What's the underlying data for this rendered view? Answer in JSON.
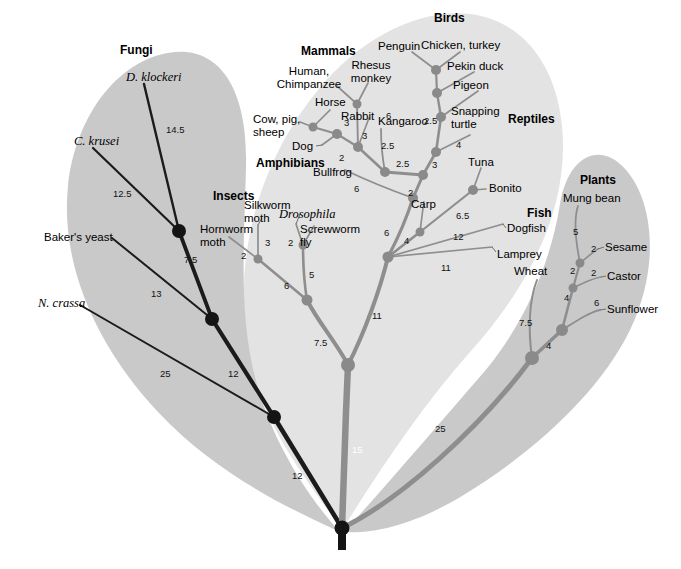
{
  "figure": {
    "kind": "phylogenetic-tree",
    "root_label": "",
    "background": "#ffffff"
  },
  "colors": {
    "lobe_outer": "#c9c9c9",
    "lobe_center": "#e3e3e3",
    "branch_dark": "#1b1b1b",
    "branch_mid": "#8e8e8e",
    "node_dark": "#141414",
    "node_mid": "#8a8a8a",
    "text": "#000000"
  },
  "groups": [
    {
      "id": "fungi",
      "label": "Fungi",
      "x": 120,
      "y": 44
    },
    {
      "id": "mammals",
      "label": "Mammals",
      "x": 301,
      "y": 45
    },
    {
      "id": "birds",
      "label": "Birds",
      "x": 434,
      "y": 12
    },
    {
      "id": "reptiles",
      "label": "Reptiles",
      "x": 508,
      "y": 113
    },
    {
      "id": "fish",
      "label": "Fish",
      "x": 527,
      "y": 207
    },
    {
      "id": "plants",
      "label": "Plants",
      "x": 580,
      "y": 174
    },
    {
      "id": "amphibians",
      "label": "Amphibians",
      "x": 256,
      "y": 157
    },
    {
      "id": "insects",
      "label": "Insects",
      "x": 213,
      "y": 190
    }
  ],
  "taxa": [
    {
      "id": "d-klockeri",
      "label": "D. klockeri",
      "style": "italic",
      "x": 126,
      "y": 71,
      "align": "left"
    },
    {
      "id": "c-krusei",
      "label": "C. krusei",
      "style": "italic",
      "x": 74,
      "y": 135,
      "align": "left"
    },
    {
      "id": "bakers-yeast",
      "label": "Baker's yeast",
      "style": "plain",
      "x": 44,
      "y": 231,
      "align": "left"
    },
    {
      "id": "n-crassa",
      "label": "N. crassa",
      "style": "italic",
      "x": 38,
      "y": 297,
      "align": "left"
    },
    {
      "id": "human-chimp",
      "label": "Human,\nChimpanzee",
      "style": "plain",
      "x": 303,
      "y": 71,
      "align": "center"
    },
    {
      "id": "rhesus-monkey",
      "label": "Rhesus\nmonkey",
      "style": "plain",
      "x": 368,
      "y": 65,
      "align": "center"
    },
    {
      "id": "horse",
      "label": "Horse",
      "style": "plain",
      "x": 315,
      "y": 102,
      "align": "left"
    },
    {
      "id": "cow-pig-sheep",
      "label": "Cow, pig,\nsheep",
      "style": "plain",
      "x": 276,
      "y": 117,
      "align": "left"
    },
    {
      "id": "rabbit",
      "label": "Rabbit",
      "style": "plain",
      "x": 341,
      "y": 112,
      "align": "left"
    },
    {
      "id": "kangaroo",
      "label": "Kangaroo",
      "style": "plain",
      "x": 380,
      "y": 118,
      "align": "left"
    },
    {
      "id": "dog",
      "label": "Dog",
      "style": "plain",
      "x": 299,
      "y": 142,
      "align": "left"
    },
    {
      "id": "bullfrog",
      "label": "Bullfrog",
      "style": "plain",
      "x": 315,
      "y": 167,
      "align": "left"
    },
    {
      "id": "penguin",
      "label": "Penguin",
      "style": "plain",
      "x": 382,
      "y": 42,
      "align": "left"
    },
    {
      "id": "chicken-turkey",
      "label": "Chicken, turkey",
      "style": "plain",
      "x": 424,
      "y": 41,
      "align": "left"
    },
    {
      "id": "pekin-duck",
      "label": "Pekin duck",
      "style": "plain",
      "x": 447,
      "y": 62,
      "align": "left"
    },
    {
      "id": "pigeon",
      "label": "Pigeon",
      "style": "plain",
      "x": 453,
      "y": 81,
      "align": "left"
    },
    {
      "id": "snapping-turtle",
      "label": "Snapping\nturtle",
      "style": "plain",
      "x": 453,
      "y": 111,
      "align": "left"
    },
    {
      "id": "tuna",
      "label": "Tuna",
      "style": "plain",
      "x": 470,
      "y": 160,
      "align": "left"
    },
    {
      "id": "bonito",
      "label": "Bonito",
      "style": "plain",
      "x": 489,
      "y": 184,
      "align": "left"
    },
    {
      "id": "carp",
      "label": "Carp",
      "style": "plain",
      "x": 411,
      "y": 202,
      "align": "left"
    },
    {
      "id": "dogfish",
      "label": "Dogfish",
      "style": "plain",
      "x": 506,
      "y": 228,
      "align": "left"
    },
    {
      "id": "lamprey",
      "label": "Lamprey",
      "style": "plain",
      "x": 495,
      "y": 254,
      "align": "left"
    },
    {
      "id": "silkworm-moth",
      "label": "Silkworm\nmoth",
      "style": "plain",
      "x": 245,
      "y": 205,
      "align": "left"
    },
    {
      "id": "hornworm-moth",
      "label": "Hornworm\nmoth",
      "style": "plain",
      "x": 203,
      "y": 228,
      "align": "left"
    },
    {
      "id": "drosophila",
      "label": "Drosophila",
      "style": "italic",
      "x": 283,
      "y": 215,
      "align": "left"
    },
    {
      "id": "screwworm-fly",
      "label": "Screwworm\nfly",
      "style": "plain",
      "x": 303,
      "y": 228,
      "align": "left"
    },
    {
      "id": "mung-bean",
      "label": "Mung bean",
      "style": "plain",
      "x": 565,
      "y": 196,
      "align": "left"
    },
    {
      "id": "sesame",
      "label": "Sesame",
      "style": "plain",
      "x": 601,
      "y": 244,
      "align": "left"
    },
    {
      "id": "castor",
      "label": "Castor",
      "style": "plain",
      "x": 604,
      "y": 273,
      "align": "left"
    },
    {
      "id": "sunflower",
      "label": "Sunflower",
      "style": "plain",
      "x": 603,
      "y": 306,
      "align": "left"
    },
    {
      "id": "wheat",
      "label": "Wheat",
      "style": "plain",
      "x": 514,
      "y": 268,
      "align": "left"
    }
  ],
  "branch_lengths": [
    {
      "id": "len-dklockeri",
      "value": "14.5",
      "x": 166,
      "y": 124,
      "white": false
    },
    {
      "id": "len-ckrusei",
      "value": "12.5",
      "x": 113,
      "y": 188,
      "white": false
    },
    {
      "id": "len-bakers",
      "value": "13",
      "x": 151,
      "y": 288,
      "white": false
    },
    {
      "id": "len-ncrassa",
      "value": "25",
      "x": 160,
      "y": 368,
      "white": false
    },
    {
      "id": "len-fungi-75",
      "value": "7.5",
      "x": 184,
      "y": 254,
      "white": false
    },
    {
      "id": "len-fungi-12a",
      "value": "12",
      "x": 228,
      "y": 368,
      "white": false
    },
    {
      "id": "len-fungi-12b",
      "value": "12",
      "x": 292,
      "y": 470,
      "white": false
    },
    {
      "id": "len-cowpig-3",
      "value": "3",
      "x": 344,
      "y": 120,
      "white": false
    },
    {
      "id": "len-rabbit-6",
      "value": "6",
      "x": 386,
      "y": 113,
      "white": false
    },
    {
      "id": "len-horse-3",
      "value": "3",
      "x": 362,
      "y": 133,
      "white": false
    },
    {
      "id": "len-dog-2",
      "value": "2",
      "x": 339,
      "y": 155,
      "white": false
    },
    {
      "id": "len-mam-25a",
      "value": "2.5",
      "x": 386,
      "y": 143,
      "white": false
    },
    {
      "id": "len-mam-25b",
      "value": "2.5",
      "x": 400,
      "y": 160,
      "white": false
    },
    {
      "id": "len-bullfrog-6",
      "value": "6",
      "x": 354,
      "y": 186,
      "white": false
    },
    {
      "id": "len-tetra-2",
      "value": "2",
      "x": 408,
      "y": 190,
      "white": false
    },
    {
      "id": "len-amniote-3",
      "value": "3",
      "x": 432,
      "y": 162,
      "white": false
    },
    {
      "id": "len-turtle-4",
      "value": "4",
      "x": 456,
      "y": 142,
      "white": false
    },
    {
      "id": "len-bird-25",
      "value": "2.5",
      "x": 428,
      "y": 118,
      "white": false
    },
    {
      "id": "len-tuna-65",
      "value": "6.5",
      "x": 458,
      "y": 213,
      "white": false
    },
    {
      "id": "len-carp-4",
      "value": "4",
      "x": 404,
      "y": 238,
      "white": false
    },
    {
      "id": "len-vert-6",
      "value": "6",
      "x": 386,
      "y": 230,
      "white": false
    },
    {
      "id": "len-dogfish-12",
      "value": "12",
      "x": 455,
      "y": 234,
      "white": false
    },
    {
      "id": "len-lamprey-11",
      "value": "11",
      "x": 443,
      "y": 265,
      "white": false
    },
    {
      "id": "len-horn-2",
      "value": "2",
      "x": 243,
      "y": 253,
      "white": false
    },
    {
      "id": "len-silk-3",
      "value": "3",
      "x": 265,
      "y": 240,
      "white": false
    },
    {
      "id": "len-dros-2",
      "value": "2",
      "x": 288,
      "y": 240,
      "white": false
    },
    {
      "id": "len-moth-6",
      "value": "6",
      "x": 286,
      "y": 283,
      "white": false
    },
    {
      "id": "len-fly-5",
      "value": "5",
      "x": 309,
      "y": 272,
      "white": false
    },
    {
      "id": "len-insect-75",
      "value": "7.5",
      "x": 316,
      "y": 340,
      "white": false
    },
    {
      "id": "len-vert-11",
      "value": "11",
      "x": 374,
      "y": 313,
      "white": false
    },
    {
      "id": "len-trunk-15",
      "value": "15",
      "x": 352,
      "y": 447,
      "white": true
    },
    {
      "id": "len-mung-5",
      "value": "5",
      "x": 575,
      "y": 229,
      "white": false
    },
    {
      "id": "len-sesame-2",
      "value": "2",
      "x": 592,
      "y": 246,
      "white": false
    },
    {
      "id": "len-plant-2a",
      "value": "2",
      "x": 572,
      "y": 268,
      "white": false
    },
    {
      "id": "len-castor-2",
      "value": "2",
      "x": 592,
      "y": 270,
      "white": false
    },
    {
      "id": "len-plant-4a",
      "value": "4",
      "x": 566,
      "y": 295,
      "white": false
    },
    {
      "id": "len-sunflower-6",
      "value": "6",
      "x": 596,
      "y": 300,
      "white": false
    },
    {
      "id": "len-wheat-75",
      "value": "7.5",
      "x": 521,
      "y": 320,
      "white": false
    },
    {
      "id": "len-plant-4b",
      "value": "4",
      "x": 548,
      "y": 343,
      "white": false
    },
    {
      "id": "len-plant-25",
      "value": "25",
      "x": 437,
      "y": 426,
      "white": false
    }
  ],
  "nodes": [
    {
      "id": "node-root",
      "x": 342,
      "y": 528,
      "r": 7.5,
      "tone": "dark"
    },
    {
      "id": "node-fungi-base",
      "x": 274,
      "y": 417,
      "r": 7.0,
      "tone": "dark"
    },
    {
      "id": "node-fungi-mid",
      "x": 212,
      "y": 319,
      "r": 7.0,
      "tone": "dark"
    },
    {
      "id": "node-fungi-top",
      "x": 179,
      "y": 231,
      "r": 7.0,
      "tone": "dark"
    },
    {
      "id": "node-animal-base",
      "x": 348,
      "y": 365,
      "r": 7.0,
      "tone": "mid"
    },
    {
      "id": "node-insect-base",
      "x": 307,
      "y": 300,
      "r": 5.5,
      "tone": "mid"
    },
    {
      "id": "node-moth",
      "x": 258,
      "y": 259,
      "r": 4.5,
      "tone": "mid"
    },
    {
      "id": "node-fly",
      "x": 303,
      "y": 245,
      "r": 4.5,
      "tone": "mid"
    },
    {
      "id": "node-vert-base",
      "x": 388,
      "y": 257,
      "r": 5.5,
      "tone": "mid"
    },
    {
      "id": "node-carp",
      "x": 420,
      "y": 232,
      "r": 4.5,
      "tone": "mid"
    },
    {
      "id": "node-tuna",
      "x": 473,
      "y": 190,
      "r": 5.0,
      "tone": "mid"
    },
    {
      "id": "node-tetrapod",
      "x": 413,
      "y": 198,
      "r": 5.0,
      "tone": "mid"
    },
    {
      "id": "node-amniote",
      "x": 423,
      "y": 175,
      "r": 5.0,
      "tone": "mid"
    },
    {
      "id": "node-turtle-split",
      "x": 436,
      "y": 152,
      "r": 5.0,
      "tone": "mid"
    },
    {
      "id": "node-bird-1",
      "x": 441,
      "y": 117,
      "r": 5.0,
      "tone": "mid"
    },
    {
      "id": "node-bird-2",
      "x": 437,
      "y": 93,
      "r": 5.0,
      "tone": "mid"
    },
    {
      "id": "node-bird-3",
      "x": 436,
      "y": 70,
      "r": 5.0,
      "tone": "mid"
    },
    {
      "id": "node-mammal-1",
      "x": 385,
      "y": 172,
      "r": 5.0,
      "tone": "mid"
    },
    {
      "id": "node-mammal-2",
      "x": 358,
      "y": 147,
      "r": 5.0,
      "tone": "mid"
    },
    {
      "id": "node-mammal-3",
      "x": 337,
      "y": 134,
      "r": 5.0,
      "tone": "mid"
    },
    {
      "id": "node-mammal-4",
      "x": 313,
      "y": 127,
      "r": 4.5,
      "tone": "mid"
    },
    {
      "id": "node-mammal-5",
      "x": 357,
      "y": 104,
      "r": 4.5,
      "tone": "mid"
    },
    {
      "id": "node-plant-base",
      "x": 532,
      "y": 358,
      "r": 7.0,
      "tone": "mid"
    },
    {
      "id": "node-plant-sun",
      "x": 562,
      "y": 330,
      "r": 6.0,
      "tone": "mid"
    },
    {
      "id": "node-plant-castor",
      "x": 573,
      "y": 288,
      "r": 4.5,
      "tone": "mid"
    },
    {
      "id": "node-plant-sesame",
      "x": 580,
      "y": 263,
      "r": 4.5,
      "tone": "mid"
    }
  ]
}
